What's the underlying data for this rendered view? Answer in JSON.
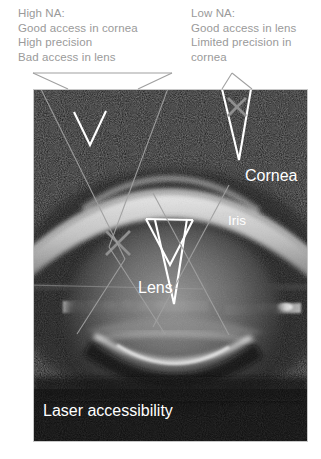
{
  "figure": {
    "background_color": "#ffffff"
  },
  "captions": {
    "high_na": {
      "heading": "High NA:",
      "lines": [
        "Good access in cornea",
        "High precision",
        "Bad access in lens"
      ],
      "text": "High NA:\nGood access in cornea\nHigh precision\nBad access in lens",
      "color": "#9a9a9a"
    },
    "low_na": {
      "heading": "Low NA:",
      "lines": [
        "Good access in lens",
        "Limited precision in",
        "cornea"
      ],
      "text": "Low NA:\nGood access in lens\nLimited precision in\ncornea",
      "color": "#9a9a9a"
    }
  },
  "image_labels": {
    "cornea": "Cornea",
    "iris": "Iris",
    "lens": "Lens",
    "bottom_caption": "Laser accessibility",
    "color": "#ffffff"
  },
  "markers": {
    "reject_mark": "X",
    "reject_color": "#8f8f8f",
    "cone_color": "#ffffff",
    "callout_line_color": "#a6a6a6",
    "cones": [
      {
        "name": "high-na-cone-cornea",
        "na": "high",
        "target": "cornea",
        "verdict": "good"
      },
      {
        "name": "low-na-cone-cornea",
        "na": "low",
        "target": "cornea",
        "verdict": "bad"
      },
      {
        "name": "high-na-cone-lens",
        "na": "high",
        "target": "lens",
        "verdict": "bad"
      },
      {
        "name": "low-na-cone-lens",
        "na": "low",
        "target": "lens",
        "verdict": "good"
      }
    ]
  }
}
